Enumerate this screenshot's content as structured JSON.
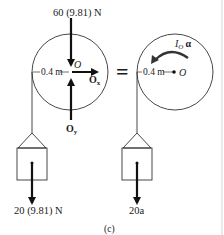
{
  "diagram": {
    "caption": "(c)",
    "equals_sign": "=",
    "fbd": {
      "top_force": "60 (9.81)  N",
      "center_label": "O",
      "radius_label": "0.4 m",
      "ox_label": "O",
      "ox_sub": "x",
      "oy_label": "O",
      "oy_sub": "y",
      "weight_label": "20 (9.81) N"
    },
    "kinetic": {
      "moment_label": "I",
      "moment_sub": "O",
      "alpha": "α",
      "radius_label": "0.4 m",
      "center_label": "O",
      "inertia_force_label": "20a"
    }
  }
}
